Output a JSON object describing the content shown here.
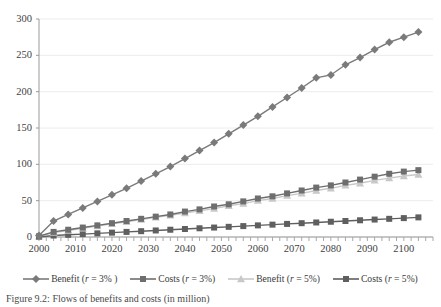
{
  "caption": "Figure 9.2: Flows of benefits and costs (in million)",
  "legend": {
    "position": "bottom",
    "items": [
      {
        "label_prefix": "Benefit (",
        "label_var": "r",
        "label_suffix": " = 3% )",
        "marker": "diamond",
        "color": "#7a7a7a"
      },
      {
        "label_prefix": "Costs (",
        "label_var": "r",
        "label_suffix": " = 3%)",
        "marker": "square",
        "color": "#6e6e6e"
      },
      {
        "label_prefix": "Benefit (",
        "label_var": "r",
        "label_suffix": " = 5%)",
        "marker": "triangle",
        "color": "#c8c8c8"
      },
      {
        "label_prefix": "Costs (",
        "label_var": "r",
        "label_suffix": " = 5%)",
        "marker": "square",
        "color": "#5f5f5f"
      }
    ]
  },
  "chart_data": {
    "type": "line",
    "title": "",
    "xlabel": "",
    "ylabel": "",
    "grid": true,
    "xlim": [
      2000,
      2108
    ],
    "ylim": [
      0,
      300
    ],
    "ytick_values": [
      0,
      50,
      100,
      150,
      200,
      250,
      300
    ],
    "ytick_labels": [
      "0",
      "50",
      "100",
      "150",
      "200",
      "250",
      "300"
    ],
    "xtick_values": [
      2000,
      2010,
      2020,
      2030,
      2040,
      2050,
      2060,
      2070,
      2080,
      2090,
      2100
    ],
    "xtick_labels": [
      "2000",
      "2010",
      "2020",
      "2030",
      "2040",
      "2050",
      "2060",
      "2070",
      "2080",
      "2090",
      "2100"
    ],
    "x": [
      2000,
      2004,
      2008,
      2012,
      2016,
      2020,
      2024,
      2028,
      2032,
      2036,
      2040,
      2044,
      2048,
      2052,
      2056,
      2060,
      2064,
      2068,
      2072,
      2076,
      2080,
      2084,
      2088,
      2092,
      2096,
      2100,
      2104
    ],
    "series": [
      {
        "name": "Benefit (r = 3% )",
        "marker": "diamond",
        "color": "#7a7a7a",
        "values": [
          2,
          22,
          31,
          40,
          49,
          58,
          67,
          77,
          87,
          97,
          108,
          119,
          130,
          142,
          154,
          166,
          179,
          192,
          205,
          219,
          223,
          237,
          247,
          258,
          268,
          275,
          282
        ]
      },
      {
        "name": "Costs (r = 3%)",
        "marker": "square",
        "color": "#6e6e6e",
        "values": [
          1,
          7,
          10,
          13,
          16,
          19,
          22,
          25,
          28,
          31,
          35,
          38,
          42,
          45,
          49,
          53,
          56,
          60,
          64,
          68,
          71,
          75,
          79,
          83,
          87,
          90,
          92
        ]
      },
      {
        "name": "Benefit (r = 5%)",
        "marker": "triangle",
        "color": "#c8c8c8",
        "values": [
          1,
          6,
          9,
          12,
          15,
          18,
          21,
          24,
          27,
          30,
          33,
          36,
          39,
          43,
          46,
          50,
          53,
          57,
          60,
          64,
          67,
          71,
          74,
          78,
          81,
          84,
          86
        ]
      },
      {
        "name": "Costs (r = 5%)",
        "marker": "square",
        "color": "#5f5f5f",
        "values": [
          0,
          2,
          3,
          4,
          5,
          6,
          7,
          8,
          9,
          10,
          11,
          12,
          13,
          14,
          15,
          16,
          17,
          18,
          19,
          20,
          21,
          22,
          23,
          24,
          25,
          26,
          27
        ]
      }
    ]
  }
}
